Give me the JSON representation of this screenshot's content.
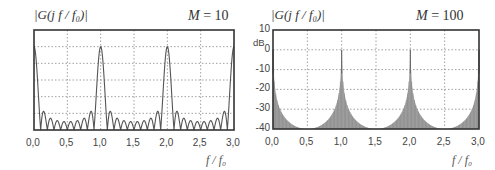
{
  "chart_data": [
    {
      "type": "line",
      "title": "|G(j f / f0)|",
      "annotation": "M = 10",
      "M": 10,
      "xlabel": "f / f0",
      "ylabel": "|G(j f / f0)|",
      "xlim": [
        0,
        3
      ],
      "ylim": [
        0,
        1.2
      ],
      "x_ticks": [
        "0,0",
        "0,5",
        "1,0",
        "1,5",
        "2,0",
        "2,5",
        "3,0"
      ],
      "y_ticks": [
        "0,0",
        "0,2",
        "0,4",
        "0,6",
        "0,8",
        "1,0",
        "1,2"
      ],
      "grid": true,
      "series": [
        {
          "name": "|G|, M=10",
          "formula": "|sin(pi*M*x) / (M*sin(pi*x))|",
          "peaks": [
            {
              "x": 0.0,
              "y": 1.0
            },
            {
              "x": 1.0,
              "y": 1.0
            },
            {
              "x": 2.0,
              "y": 1.0
            },
            {
              "x": 3.0,
              "y": 1.0
            }
          ],
          "first_sidelobe": 0.22,
          "min_sidelobe": 0.1
        }
      ]
    },
    {
      "type": "area",
      "title": "|G(j f / f0)|",
      "annotation": "M = 100",
      "M": 100,
      "xlabel": "f / f0",
      "ylabel": "dB",
      "xlim": [
        0,
        3
      ],
      "ylim": [
        -40,
        10
      ],
      "x_ticks": [
        "0,0",
        "0,5",
        "1,0",
        "1,5",
        "2,0",
        "2,5",
        "3,0"
      ],
      "y_ticks": [
        "-40",
        "-30",
        "-20",
        "-10",
        "0",
        "10"
      ],
      "grid": true,
      "series": [
        {
          "name": "|G| dB, M=100",
          "formula": "20*log10(|sin(pi*M*x) / (M*sin(pi*x))|)",
          "peaks": [
            {
              "x": 0.0,
              "y": 0
            },
            {
              "x": 1.0,
              "y": 0
            },
            {
              "x": 2.0,
              "y": 0
            },
            {
              "x": 3.0,
              "y": 0
            }
          ],
          "floor_db": -40
        }
      ]
    }
  ],
  "left": {
    "title": "|G(j f / f₀)|",
    "m_sym": "M",
    "m_val": "= 10",
    "xlabel": "f / f₀"
  },
  "right": {
    "title": "|G(j f / f₀)|",
    "m_sym": "M",
    "m_val": "= 100",
    "xlabel": "f / f₀",
    "unit": "dB"
  }
}
